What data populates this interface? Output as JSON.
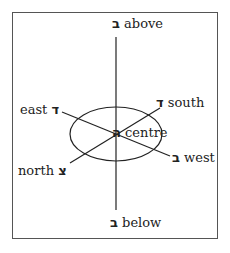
{
  "diagram": {
    "title": "",
    "labels": {
      "above": {
        "letter": "ב",
        "text": "above"
      },
      "below": {
        "letter": "ב",
        "text": "below"
      },
      "east": {
        "letter": "ד",
        "text": "east"
      },
      "south": {
        "letter": "ד",
        "text": "south"
      },
      "west": {
        "letter": "ב",
        "text": "west"
      },
      "north": {
        "letter": "צ",
        "text": "north"
      },
      "centre": {
        "letter": "ה",
        "text": "centre"
      }
    }
  }
}
